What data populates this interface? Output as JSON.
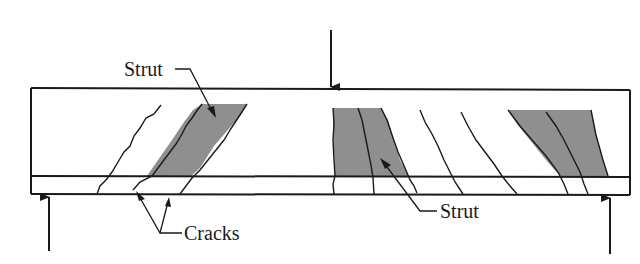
{
  "diagram": {
    "labels": {
      "strut_top": "Strut",
      "strut_bottom": "Strut",
      "cracks": "Cracks"
    },
    "colors": {
      "line": "#1a1a1a",
      "strut_fill": "#8f8f8f",
      "background": "#ffffff"
    },
    "elements": {
      "load_arrow": "downward applied load at midspan",
      "support_left": "upward reaction left support",
      "support_right": "upward reaction right support",
      "reinforcement_line": "longitudinal tension reinforcement layer"
    }
  }
}
